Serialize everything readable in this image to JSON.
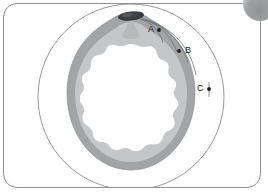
{
  "figure": {
    "type": "annotated-cross-section-diagram",
    "panel": {
      "background_color": "#ffffff",
      "border_color": "#8f9193",
      "corner_radius_px": 14
    },
    "corner_badge": {
      "name": "clipped-circular-badge",
      "color": "#9a9c9e",
      "position": "top-right"
    },
    "structure": {
      "outer_circle": {
        "label": "outer thin boundary circle",
        "stroke_color": "#8a8c8e",
        "fill": "none"
      },
      "outer_ring_band": {
        "label": "dark gray outer band",
        "color": "#9fa1a3"
      },
      "inner_ring_band": {
        "label": "light gray inner band",
        "color": "#c2c4c5"
      },
      "lumen": {
        "label": "white scalloped interior lumen",
        "color": "#ffffff"
      },
      "apex_object": {
        "label": "dark elongated object at apex",
        "color": "#3a3c40"
      }
    },
    "annotations": [
      {
        "id": "A",
        "label": "A",
        "point_x": 159,
        "point_y": 30,
        "text_x": 148,
        "text_y": 26
      },
      {
        "id": "B",
        "label": "B",
        "point_x": 179,
        "point_y": 51,
        "text_x": 185,
        "text_y": 47
      },
      {
        "id": "C",
        "label": "C",
        "point_x": 209,
        "point_y": 89,
        "text_x": 197,
        "text_y": 85
      }
    ],
    "leader_lines_count": 4,
    "leader_line_color": "#6f7174"
  }
}
